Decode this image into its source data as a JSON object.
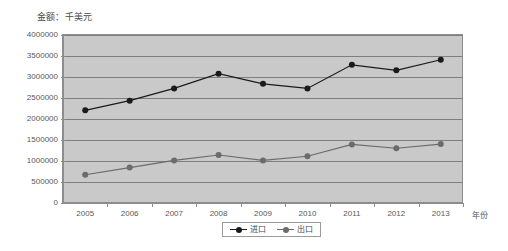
{
  "chart_data": {
    "type": "line",
    "title": "金额：千美元",
    "xlabel": "年份",
    "ylabel": "",
    "categories": [
      "2005",
      "2006",
      "2007",
      "2008",
      "2009",
      "2010",
      "2011",
      "2012",
      "2013"
    ],
    "ylim": [
      0,
      4000000
    ],
    "ytick_step": 500000,
    "yticks": [
      "0",
      "500000",
      "1000000",
      "1500000",
      "2000000",
      "2500000",
      "3000000",
      "3500000",
      "4000000"
    ],
    "grid": true,
    "legend_position": "bottom-center",
    "series": [
      {
        "name": "进口",
        "color": "#1a1a1a",
        "marker": "circle",
        "values": [
          2200000,
          2430000,
          2720000,
          3070000,
          2830000,
          2720000,
          3280000,
          3150000,
          3400000
        ]
      },
      {
        "name": "出口",
        "color": "#6b6b6b",
        "marker": "circle",
        "values": [
          670000,
          840000,
          1010000,
          1140000,
          1010000,
          1110000,
          1390000,
          1300000,
          1400000
        ]
      }
    ],
    "plot_background": "#c9c9c9",
    "gridline_color": "#7f7f7f",
    "axis_color": "#8d8d8d",
    "text_color": "#58585a"
  }
}
